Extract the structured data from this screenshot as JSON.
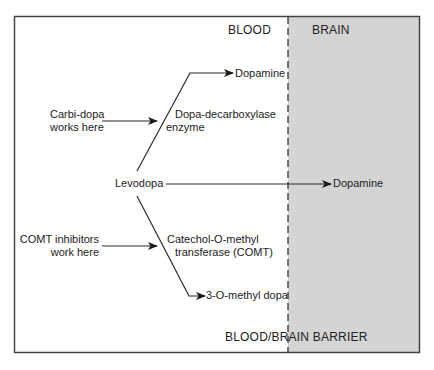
{
  "colors": {
    "background": "#ffffff",
    "brain_region": "#d4d4d4",
    "lines": "#2a2a2a",
    "border": "#444444"
  },
  "regions": {
    "blood_label": "BLOOD",
    "brain_label": "BRAIN",
    "barrier_label": "BLOOD/BRAIN BARRIER"
  },
  "nodes": {
    "levodopa": "Levodopa",
    "dopamine_blood": "Dopamine",
    "dopamine_brain": "Dopamine",
    "methyl_dopa": "3-O-methyl dopa"
  },
  "enzymes": {
    "ddc_line1": "Dopa-decarboxylase",
    "ddc_line2": "enzyme",
    "comt_line1": "Catechol-O-methyl",
    "comt_line2": "transferase (COMT)"
  },
  "inhibitors": {
    "carbidopa_line1": "Carbi-dopa",
    "carbidopa_line2": "works here",
    "comt_inhib_line1": "COMT inhibitors",
    "comt_inhib_line2": "work here"
  }
}
